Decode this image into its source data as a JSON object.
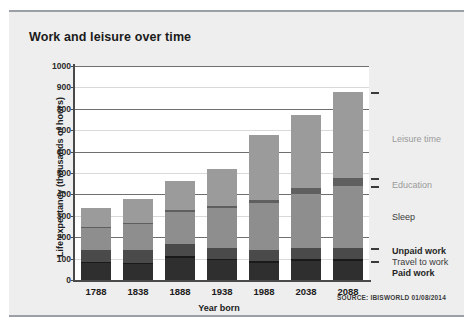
{
  "figure": {
    "title": "Work and leisure over time",
    "source": "SOURCE: IBISWORLD 01/08/2014"
  },
  "axes": {
    "ylabel": "Life expectancy (thousands of hours)",
    "xlabel": "Year born",
    "yticks": [
      "1000",
      "900",
      "800",
      "700",
      "600",
      "500",
      "400",
      "300",
      "200",
      "100",
      "0"
    ]
  },
  "category_labels": [
    {
      "text": "Leisure time",
      "style": "light"
    },
    {
      "text": "Education",
      "style": "light"
    },
    {
      "text": "Sleep",
      "style": "plain"
    },
    {
      "text": "Unpaid work",
      "style": "dark"
    },
    {
      "text": "Travel to work",
      "style": "plain"
    },
    {
      "text": "Paid work",
      "style": "dark"
    }
  ],
  "colors": {
    "paid_work": "#2f2f2f",
    "travel_to_work": "#1a1a1a",
    "unpaid_work": "#4a4a4a",
    "sleep": "#8e8e8e",
    "education": "#5f5f5f",
    "leisure_time": "#9b9b9b",
    "panel_background": "#eeeeee",
    "plot_background": "#ffffff"
  },
  "chart_data": {
    "type": "bar",
    "subtype": "stacked",
    "title": "Work and leisure over time",
    "xlabel": "Year born",
    "ylabel": "Life expectancy (thousands of hours)",
    "ylim": [
      0,
      1000
    ],
    "ytick_step": 100,
    "grid": true,
    "legend_position": "right-inline-labels",
    "categories": [
      "1788",
      "1838",
      "1888",
      "1938",
      "1988",
      "2038",
      "2088"
    ],
    "series": [
      {
        "name": "Paid work",
        "values": [
          80,
          75,
          105,
          95,
          80,
          90,
          90
        ]
      },
      {
        "name": "Travel to work",
        "values": [
          5,
          5,
          8,
          5,
          8,
          8,
          8
        ]
      },
      {
        "name": "Unpaid work",
        "values": [
          55,
          60,
          55,
          50,
          52,
          50,
          52
        ]
      },
      {
        "name": "Sleep",
        "values": [
          105,
          120,
          150,
          185,
          220,
          255,
          290
        ]
      },
      {
        "name": "Education",
        "values": [
          5,
          5,
          8,
          10,
          12,
          25,
          35
        ]
      },
      {
        "name": "Leisure time",
        "values": [
          85,
          113,
          139,
          175,
          305,
          342,
          405
        ]
      }
    ],
    "totals": [
      335,
      378,
      465,
      520,
      677,
      770,
      880
    ]
  }
}
